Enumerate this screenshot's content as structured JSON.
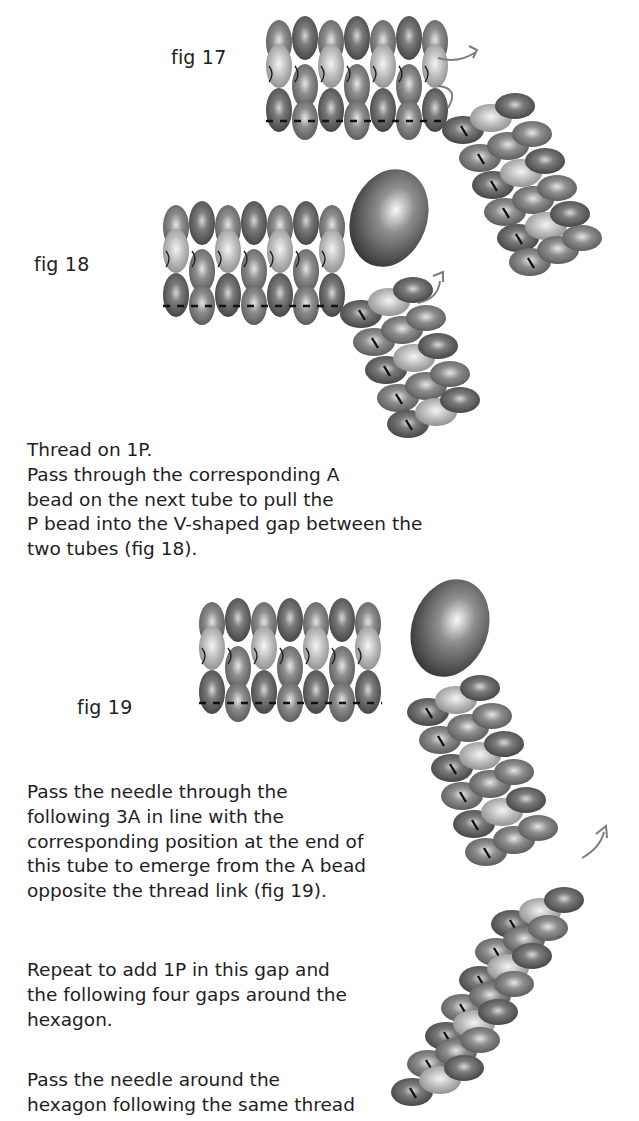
{
  "figures": [
    {
      "id": "fig17",
      "label": "fig 17"
    },
    {
      "id": "fig18",
      "label": "fig 18"
    },
    {
      "id": "fig19",
      "label": "fig 19"
    }
  ],
  "paragraphs": [
    {
      "lines": [
        "Thread on 1P.",
        "Pass through the corresponding A",
        "bead on the next tube to pull the",
        "P bead into the V-shaped gap between the",
        "two tubes (fig 18)."
      ]
    },
    {
      "lines": [
        "Pass the needle through the",
        "following 3A in line with the",
        "corresponding position at the end of",
        "this tube to emerge from the A bead",
        "opposite the thread link (fig 19)."
      ]
    },
    {
      "lines": [
        "Repeat to add 1P in this gap and",
        "the following four gaps around the",
        "hexagon."
      ]
    },
    {
      "lines": [
        "Pass the needle around the",
        "hexagon following the same thread"
      ]
    }
  ],
  "colors": {
    "bead_dark": "#5a5a5a",
    "bead_mid": "#7a7a7a",
    "bead_light": "#b8b8b8",
    "thread_arrow": "#7d7d7d",
    "text": "#1e1e1e"
  }
}
